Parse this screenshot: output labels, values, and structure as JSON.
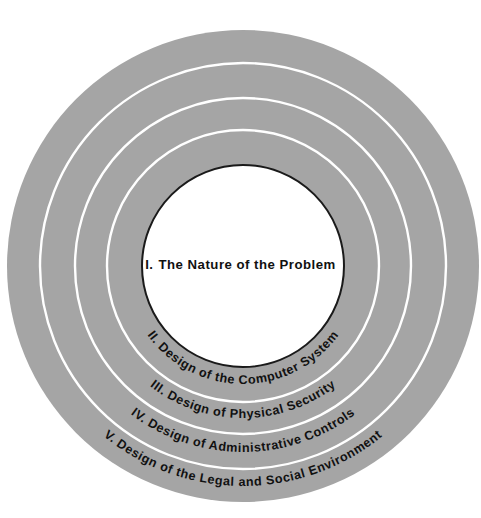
{
  "diagram": {
    "type": "concentric-rings",
    "center": {
      "x": 243,
      "y": 266
    },
    "colors": {
      "background": "#ffffff",
      "band": "#a5a5a5",
      "divider": "#ffffff",
      "core_fill": "#ffffff",
      "core_stroke": "#1a1a1a",
      "text": "#111111"
    },
    "core": {
      "numeral": "I.",
      "label": "The Nature of the Problem",
      "radius": 101
    },
    "rings": [
      {
        "numeral": "II.",
        "label": "Design of the Computer System",
        "full_label": "II.  Design of the Computer System",
        "outer_radius": 136,
        "inner_radius": 101,
        "text_radius": 118,
        "arc_span_deg": 126
      },
      {
        "numeral": "III.",
        "label": "Design of Physical Security",
        "full_label": "III.  Design of Physical Security",
        "outer_radius": 168,
        "inner_radius": 136,
        "text_radius": 152,
        "arc_span_deg": 102
      },
      {
        "numeral": "IV.",
        "label": "Design of Administrative Controls",
        "full_label": "IV.  Design of Administrative Controls",
        "outer_radius": 203,
        "inner_radius": 168,
        "text_radius": 186,
        "arc_span_deg": 104
      },
      {
        "numeral": "V.",
        "label": "Design of the Legal and Social Environment",
        "full_label": "V.  Design of the Legal and Social Environment",
        "outer_radius": 236,
        "inner_radius": 203,
        "text_radius": 220,
        "arc_span_deg": 112
      }
    ]
  }
}
